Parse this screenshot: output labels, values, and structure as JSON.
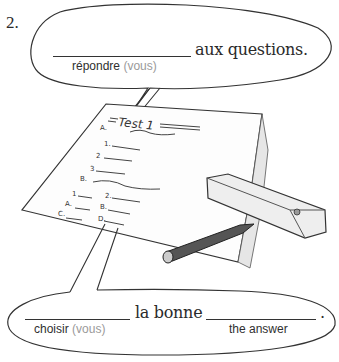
{
  "exercise": {
    "number": "2.",
    "bubble_top": {
      "text_after_blank": "aux questions.",
      "hint_verb": "répondre",
      "hint_subject": "(vous)"
    },
    "illustration": {
      "paper_title": "Test 1",
      "paper_items": [
        "A.",
        "1.",
        "2",
        "3",
        "B.",
        "1",
        "2.",
        "A.",
        "B.",
        "C.",
        "D."
      ]
    },
    "bubble_bottom": {
      "text_between_blanks": "la bonne",
      "ending_punctuation": ".",
      "hint_verb": "choisir",
      "hint_subject": "(vous)",
      "hint_second_blank": "the answer"
    }
  },
  "colors": {
    "ink": "#2a2a2a",
    "hint_grey": "#9a9a9a"
  }
}
